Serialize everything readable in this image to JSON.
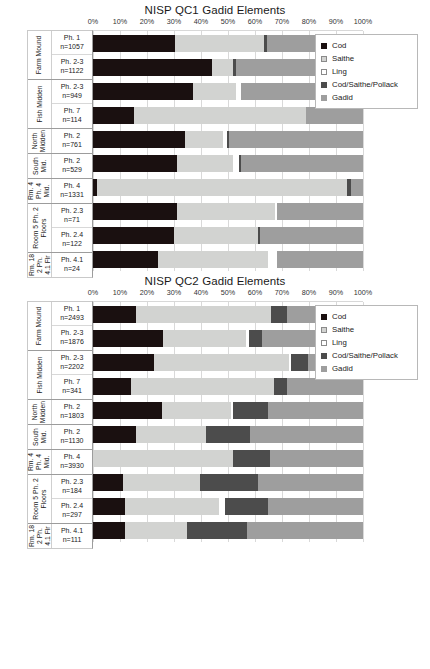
{
  "charts": [
    {
      "title": "NISP QC1 Gadid Elements",
      "legend": {
        "items": [
          {
            "label": "Cod",
            "key": "cod",
            "color": "#1a1010"
          },
          {
            "label": "Saithe",
            "key": "saithe",
            "color": "#d2d3d1"
          },
          {
            "label": "Ling",
            "key": "ling",
            "color": "#ffffff"
          },
          {
            "label": "Cod/Saithe/Pollack",
            "key": "csp",
            "color": "#4c4c4c"
          },
          {
            "label": "Gadid",
            "key": "gadid",
            "color": "#9e9e9e"
          }
        ]
      },
      "chart_data": {
        "type": "bar",
        "orientation": "horizontal",
        "stacked": true,
        "normalized": true,
        "title": "NISP QC1 Gadid Elements",
        "xlabel": "",
        "ylabel": "",
        "xlim": [
          0,
          100
        ],
        "xticks": [
          "0%",
          "10%",
          "20%",
          "30%",
          "40%",
          "50%",
          "60%",
          "70%",
          "80%",
          "90%",
          "100%"
        ],
        "grid": true,
        "legend_position": "upper-right-inset",
        "series": [
          {
            "name": "Cod",
            "values": [
              30.5,
              44.0,
              37.0,
              15.0,
              34.0,
              31.0,
              1.5,
              31.0,
              30.0,
              24.0
            ]
          },
          {
            "name": "Saithe",
            "values": [
              33.0,
              8.0,
              16.0,
              64.0,
              14.0,
              21.0,
              92.5,
              36.5,
              31.0,
              41.0
            ]
          },
          {
            "name": "Ling",
            "values": [
              0.0,
              0.0,
              2.0,
              0.0,
              1.5,
              2.0,
              0.0,
              0.5,
              0.0,
              3.0
            ]
          },
          {
            "name": "Cod/Saithe/Pollack",
            "values": [
              1.0,
              0.8,
              0.0,
              0.0,
              0.8,
              0.8,
              1.5,
              0.0,
              1.0,
              0.0
            ]
          },
          {
            "name": "Gadid",
            "values": [
              35.5,
              47.2,
              45.0,
              21.0,
              49.7,
              45.2,
              4.5,
              32.0,
              38.0,
              32.0
            ]
          }
        ],
        "categories": [
          "Ph. 1 n=1057",
          "Ph. 2-3 n=1122",
          "Ph. 2-3 n=949",
          "Ph. 7 n=114",
          "Ph. 2 n=761",
          "Ph. 2 n=529",
          "Ph. 4 n=1331",
          "Ph. 2.3 n=71",
          "Ph. 2.4 n=122",
          "Ph. 4.1 n=24"
        ]
      },
      "groups": [
        {
          "name_lines": [
            "Farm Mound"
          ],
          "rows": [
            {
              "phase": "Ph. 1",
              "n": "n=1057",
              "segs": [
                30.5,
                33.0,
                0.0,
                1.0,
                35.5
              ]
            },
            {
              "phase": "Ph. 2-3",
              "n": "n=1122",
              "segs": [
                44.0,
                8.0,
                0.0,
                0.8,
                47.2
              ]
            }
          ]
        },
        {
          "name_lines": [
            "Fish Midden"
          ],
          "rows": [
            {
              "phase": "Ph. 2-3",
              "n": "n=949",
              "segs": [
                37.0,
                16.0,
                2.0,
                0.0,
                45.0
              ]
            },
            {
              "phase": "Ph. 7",
              "n": "n=114",
              "segs": [
                15.0,
                64.0,
                0.0,
                0.0,
                21.0
              ]
            }
          ]
        },
        {
          "name_lines": [
            "North",
            "Midden"
          ],
          "rows": [
            {
              "phase": "Ph. 2",
              "n": "n=761",
              "segs": [
                34.0,
                14.0,
                1.5,
                0.8,
                49.7
              ]
            }
          ]
        },
        {
          "name_lines": [
            "South",
            "Mid."
          ],
          "rows": [
            {
              "phase": "Ph. 2",
              "n": "n=529",
              "segs": [
                31.0,
                21.0,
                2.0,
                0.8,
                45.2
              ]
            }
          ]
        },
        {
          "name_lines": [
            "Rm. 4",
            "Ph. 4",
            "Mid."
          ],
          "rows": [
            {
              "phase": "Ph. 4",
              "n": "n=1331",
              "segs": [
                1.5,
                92.5,
                0.0,
                1.5,
                4.5
              ]
            }
          ]
        },
        {
          "name_lines": [
            "Room 5 Ph. 2",
            "Floors"
          ],
          "rows": [
            {
              "phase": "Ph. 2.3",
              "n": "n=71",
              "segs": [
                31.0,
                36.5,
                0.5,
                0.0,
                32.0
              ]
            },
            {
              "phase": "Ph. 2.4",
              "n": "n=122",
              "segs": [
                30.0,
                31.0,
                0.0,
                1.0,
                38.0
              ]
            }
          ]
        },
        {
          "name_lines": [
            "Rm. 18",
            "2 Ph.",
            "4.1 Flr"
          ],
          "rows": [
            {
              "phase": "Ph. 4.1",
              "n": "n=24",
              "segs": [
                24.0,
                41.0,
                3.0,
                0.0,
                32.0
              ]
            }
          ]
        }
      ]
    },
    {
      "title": "NISP QC2 Gadid Elements",
      "legend": {
        "items": [
          {
            "label": "Cod",
            "key": "cod",
            "color": "#1a1010"
          },
          {
            "label": "Saithe",
            "key": "saithe",
            "color": "#d2d3d1"
          },
          {
            "label": "Ling",
            "key": "ling",
            "color": "#ffffff"
          },
          {
            "label": "Cod/Saithe/Pollack",
            "key": "csp",
            "color": "#4c4c4c"
          },
          {
            "label": "Gadid",
            "key": "gadid",
            "color": "#9e9e9e"
          }
        ]
      },
      "chart_data": {
        "type": "bar",
        "orientation": "horizontal",
        "stacked": true,
        "normalized": true,
        "title": "NISP QC2 Gadid Elements",
        "xlabel": "",
        "ylabel": "",
        "xlim": [
          0,
          100
        ],
        "xticks": [
          "0%",
          "10%",
          "20%",
          "30%",
          "40%",
          "50%",
          "60%",
          "70%",
          "80%",
          "90%",
          "100%"
        ],
        "grid": true,
        "legend_position": "upper-right-inset",
        "series": [
          {
            "name": "Cod",
            "values": [
              16.0,
              26.0,
              22.5,
              14.0,
              25.5,
              16.0,
              0.0,
              11.0,
              12.0,
              12.0
            ]
          },
          {
            "name": "Saithe",
            "values": [
              50.0,
              30.5,
              50.0,
              53.0,
              25.5,
              26.0,
              52.0,
              28.5,
              34.5,
              23.0
            ]
          },
          {
            "name": "Ling",
            "values": [
              0.0,
              1.2,
              1.0,
              0.0,
              1.0,
              0.0,
              0.0,
              0.0,
              2.5,
              0.0
            ]
          },
          {
            "name": "Cod/Saithe/Pollack",
            "values": [
              6.0,
              4.8,
              6.0,
              5.0,
              13.0,
              16.0,
              13.5,
              21.5,
              16.0,
              22.0
            ]
          },
          {
            "name": "Gadid",
            "values": [
              28.0,
              37.5,
              20.5,
              28.0,
              35.0,
              42.0,
              34.5,
              39.0,
              35.0,
              43.0
            ]
          }
        ],
        "categories": [
          "Ph. 1 n=2493",
          "Ph. 2-3 n=1876",
          "Ph. 2-3 n=2202",
          "Ph. 7 n=341",
          "Ph. 2 n=1803",
          "Ph. 2 n=1130",
          "Ph. 4 n=3930",
          "Ph. 2.3 n=184",
          "Ph. 2.4 n=297",
          "Ph. 4.1 n=111"
        ]
      },
      "groups": [
        {
          "name_lines": [
            "Farm Mound"
          ],
          "rows": [
            {
              "phase": "Ph. 1",
              "n": "n=2493",
              "segs": [
                16.0,
                50.0,
                0.0,
                6.0,
                28.0
              ]
            },
            {
              "phase": "Ph. 2-3",
              "n": "n=1876",
              "segs": [
                26.0,
                30.5,
                1.2,
                4.8,
                37.5
              ]
            }
          ]
        },
        {
          "name_lines": [
            "Fish Midden"
          ],
          "rows": [
            {
              "phase": "Ph. 2-3",
              "n": "n=2202",
              "segs": [
                22.5,
                50.0,
                1.0,
                6.0,
                20.5
              ]
            },
            {
              "phase": "Ph. 7",
              "n": "n=341",
              "segs": [
                14.0,
                53.0,
                0.0,
                5.0,
                28.0
              ]
            }
          ]
        },
        {
          "name_lines": [
            "North",
            "Midden"
          ],
          "rows": [
            {
              "phase": "Ph. 2",
              "n": "n=1803",
              "segs": [
                25.5,
                25.5,
                1.0,
                13.0,
                35.0
              ]
            }
          ]
        },
        {
          "name_lines": [
            "South",
            "Mid."
          ],
          "rows": [
            {
              "phase": "Ph. 2",
              "n": "n=1130",
              "segs": [
                16.0,
                26.0,
                0.0,
                16.0,
                42.0
              ]
            }
          ]
        },
        {
          "name_lines": [
            "Rm. 4",
            "Ph. 4",
            "Mid."
          ],
          "rows": [
            {
              "phase": "Ph. 4",
              "n": "n=3930",
              "segs": [
                0.0,
                52.0,
                0.0,
                13.5,
                34.5
              ]
            }
          ]
        },
        {
          "name_lines": [
            "Room 5 Ph. 2",
            "Floors"
          ],
          "rows": [
            {
              "phase": "Ph. 2.3",
              "n": "n=184",
              "segs": [
                11.0,
                28.5,
                0.0,
                21.5,
                39.0
              ]
            },
            {
              "phase": "Ph. 2.4",
              "n": "n=297",
              "segs": [
                12.0,
                34.5,
                2.5,
                16.0,
                35.0
              ]
            }
          ]
        },
        {
          "name_lines": [
            "Rm. 18",
            "2 Ph.",
            "4.1 Flr"
          ],
          "rows": [
            {
              "phase": "Ph. 4.1",
              "n": "n=111",
              "segs": [
                12.0,
                23.0,
                0.0,
                22.0,
                43.0
              ]
            }
          ]
        }
      ]
    }
  ]
}
